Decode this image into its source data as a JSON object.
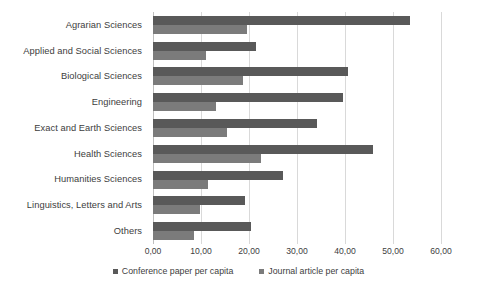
{
  "chart_data": {
    "type": "bar",
    "orientation": "horizontal",
    "title": "",
    "xlabel": "",
    "ylabel": "",
    "xlim": [
      0,
      60
    ],
    "grid": true,
    "legend_position": "bottom",
    "categories": [
      "Agrarian Sciences",
      "Applied and Social Sciences",
      "Biological Sciences",
      "Engineering",
      "Exact and Earth Sciences",
      "Health Sciences",
      "Humanities Sciences",
      "Linguistics, Letters and Arts",
      "Others"
    ],
    "series": [
      {
        "name": "Conference paper per capita",
        "color": "#595959",
        "values": [
          53.5,
          21.5,
          40.6,
          39.6,
          34.2,
          45.8,
          27.1,
          19.2,
          20.4
        ]
      },
      {
        "name": "Journal article per capita",
        "color": "#7b7b7b",
        "values": [
          19.6,
          11.0,
          18.8,
          13.1,
          15.4,
          22.5,
          11.4,
          9.8,
          8.5
        ]
      }
    ],
    "tick_labels": [
      "0,00",
      "10,00",
      "20,00",
      "30,00",
      "40,00",
      "50,00",
      "60,00"
    ],
    "tick_values": [
      0,
      10,
      20,
      30,
      40,
      50,
      60
    ]
  }
}
